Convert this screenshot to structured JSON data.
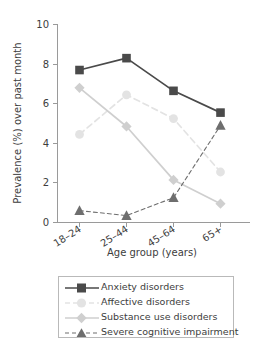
{
  "chart_data": {
    "type": "line",
    "title": "",
    "xlabel": "Age group (years)",
    "ylabel": "Prevalence (%) over past month",
    "categories": [
      "18–24",
      "25–44",
      "45–64",
      "65+"
    ],
    "ylim": [
      0,
      10
    ],
    "yticks": [
      0,
      2,
      4,
      6,
      8,
      10
    ],
    "yticklabels": [
      "0",
      "2",
      "4",
      "6",
      "8",
      "10"
    ],
    "grid": false,
    "legend_position": "bottom",
    "series": [
      {
        "name": "Anxiety disorders",
        "values": [
          7.7,
          8.3,
          6.65,
          5.55
        ],
        "color": "#4a4a4a",
        "marker": "square",
        "linestyle": "solid"
      },
      {
        "name": "Affective disorders",
        "values": [
          4.45,
          6.45,
          5.25,
          2.55
        ],
        "color": "#e3e3e3",
        "marker": "circle",
        "linestyle": "dashed"
      },
      {
        "name": "Substance use disorders",
        "values": [
          6.8,
          4.85,
          2.15,
          0.95
        ],
        "color": "#cfcfcf",
        "marker": "diamond",
        "linestyle": "solid"
      },
      {
        "name": "Severe cognitive impairment",
        "values": [
          0.6,
          0.35,
          1.25,
          4.9
        ],
        "color": "#6e6e6e",
        "marker": "triangle",
        "linestyle": "dashed"
      }
    ]
  },
  "axes": {
    "x_title": "Age group (years)",
    "y_title": "Prevalence (%) over past month",
    "x_labels": [
      "18–24",
      "25–44",
      "45–64",
      "65+"
    ],
    "y_labels": [
      "0",
      "2",
      "4",
      "6",
      "8",
      "10"
    ]
  },
  "legend": {
    "items": [
      {
        "label": "Anxiety disorders"
      },
      {
        "label": "Affective disorders"
      },
      {
        "label": "Substance use disorders"
      },
      {
        "label": "Severe cognitive impairment"
      }
    ]
  },
  "colors": {
    "anxiety": "#4a4a4a",
    "affective": "#e3e3e3",
    "substance": "#cfcfcf",
    "cognitive": "#6e6e6e",
    "axis": "#9a9a9a",
    "text": "#3d3d3d",
    "background": "#ffffff"
  }
}
